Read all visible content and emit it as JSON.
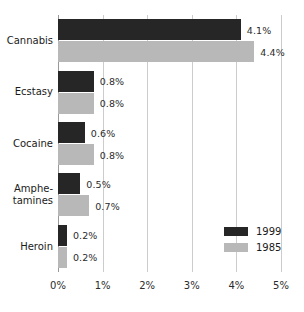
{
  "chart_data": {
    "type": "bar",
    "orientation": "horizontal",
    "title": "",
    "subtitle": "",
    "xlabel": "",
    "ylabel": "",
    "xlim": [
      0,
      5
    ],
    "xtick_labels": [
      "0%",
      "1%",
      "2%",
      "3%",
      "4%",
      "5%"
    ],
    "xtick_values": [
      0,
      1,
      2,
      3,
      4,
      5
    ],
    "grid": true,
    "legend_position": "bottom-right",
    "categories": [
      "Cannabis",
      "Ecstasy",
      "Cocaine",
      "Amphe-\ntamines",
      "Heroin"
    ],
    "series": [
      {
        "name": "1999",
        "color": "#262626",
        "values": [
          4.1,
          0.8,
          0.6,
          0.5,
          0.2
        ],
        "labels": [
          "4.1%",
          "0.8%",
          "0.6%",
          "0.5%",
          "0.2%"
        ]
      },
      {
        "name": "1985",
        "color": "#b8b8b8",
        "values": [
          4.4,
          0.8,
          0.8,
          0.7,
          0.2
        ],
        "labels": [
          "4.4%",
          "0.8%",
          "0.8%",
          "0.7%",
          "0.2%"
        ]
      }
    ]
  },
  "legend": {
    "items": [
      {
        "label": "1999",
        "color": "#262626"
      },
      {
        "label": "1985",
        "color": "#b8b8b8"
      }
    ]
  },
  "colors": {
    "series_1999": "#262626",
    "series_1985": "#b8b8b8",
    "gridline": "#cccccc",
    "axis": "#999999",
    "text": "#1a1a1a",
    "background": "#ffffff"
  }
}
